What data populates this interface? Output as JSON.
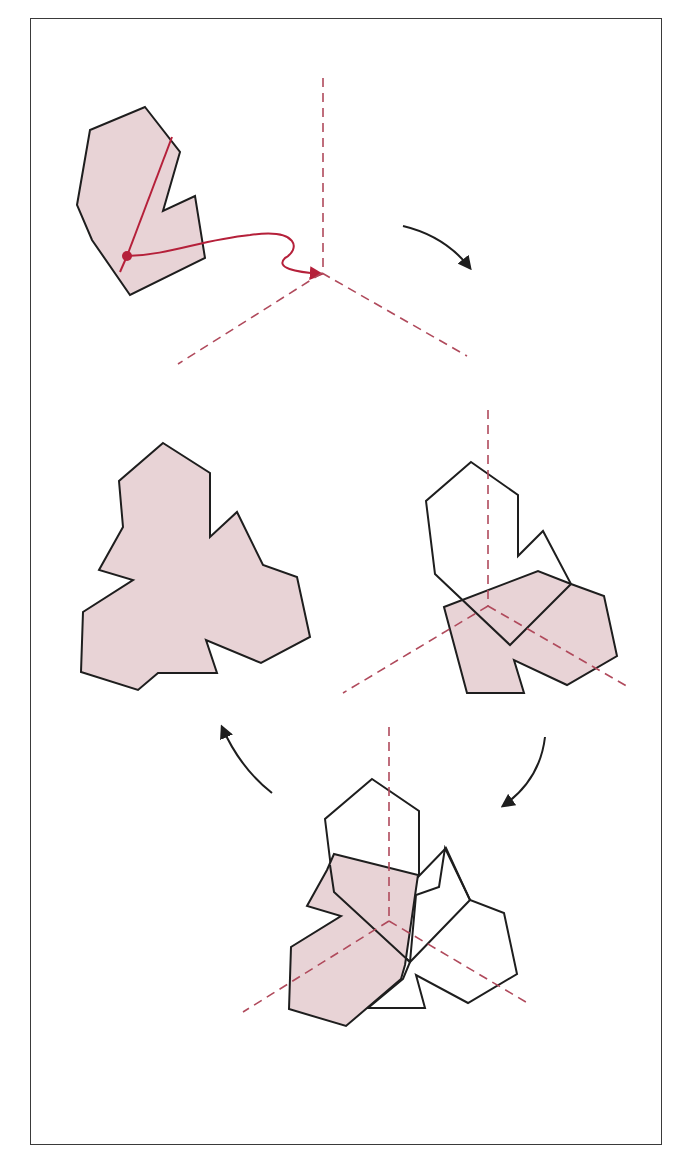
{
  "figure": {
    "colors": {
      "shape_fill": "#e8d3d6",
      "outline": "#1e1e1e",
      "axis": "#b04a5c",
      "path": "#b5203a",
      "frame": "#3a3a3a"
    },
    "panels": [
      {
        "id": "step-1",
        "label": "original shape with marked point and translation path"
      },
      {
        "id": "step-2",
        "label": "first rotated copy about center"
      },
      {
        "id": "step-3",
        "label": "second rotated copy about center"
      },
      {
        "id": "step-4",
        "label": "final three-fold symmetric union"
      }
    ],
    "arrows": [
      {
        "from": "step-1",
        "to": "step-2",
        "direction": "clockwise"
      },
      {
        "from": "step-2",
        "to": "step-3",
        "direction": "clockwise"
      },
      {
        "from": "step-3",
        "to": "step-4",
        "direction": "clockwise"
      }
    ]
  }
}
